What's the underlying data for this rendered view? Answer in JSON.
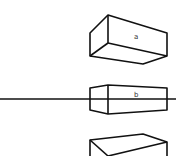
{
  "diagram": {
    "title": "",
    "type": "perspective-boxes",
    "horizon_line": {
      "y": 99
    },
    "boxes": [
      {
        "id": "a",
        "label": "a",
        "position": "above-horizon"
      },
      {
        "id": "b",
        "label": "b",
        "position": "on-horizon"
      },
      {
        "id": "c",
        "label": "",
        "position": "below-horizon"
      }
    ]
  },
  "labels": {
    "a": "a",
    "b": "b"
  }
}
